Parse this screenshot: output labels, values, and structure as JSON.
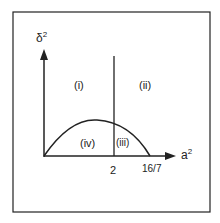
{
  "diagram": {
    "y_axis_label": "δ",
    "y_axis_exp": "2",
    "x_axis_label": "a",
    "x_axis_exp": "2",
    "x_ticks": [
      "2",
      "16/7"
    ],
    "regions": [
      "(i)",
      "(ii)",
      "(iii)",
      "(iv)"
    ],
    "colors": {
      "ink": "#222222",
      "background": "#ffffff"
    }
  }
}
